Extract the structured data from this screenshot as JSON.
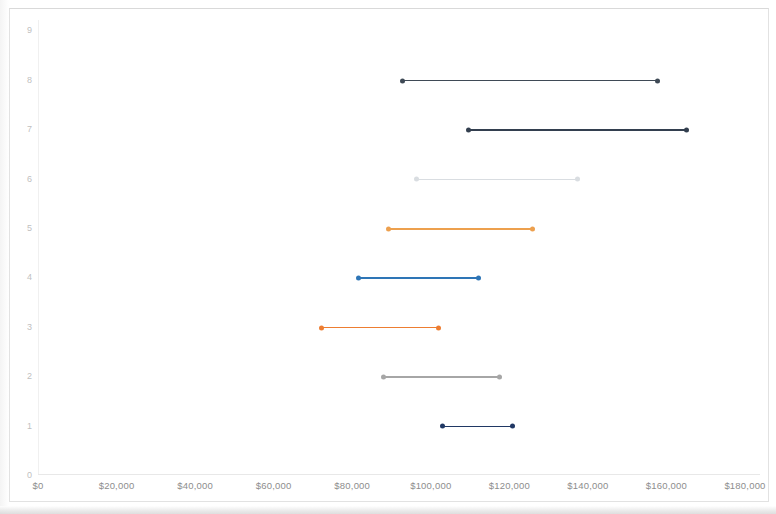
{
  "chart_data": {
    "type": "range-dot-plot",
    "title": "",
    "subtitle": "",
    "xlabel": "",
    "ylabel": "",
    "grid": false,
    "legend": "none",
    "xlim": [
      0,
      180000
    ],
    "ylim": [
      0,
      9
    ],
    "x_ticks": [
      {
        "label": "$0",
        "value": 0
      },
      {
        "label": "$20,000",
        "value": 20000
      },
      {
        "label": "$40,000",
        "value": 40000
      },
      {
        "label": "$60,000",
        "value": 60000
      },
      {
        "label": "$80,000",
        "value": 80000
      },
      {
        "label": "$100,000",
        "value": 100000
      },
      {
        "label": "$120,000",
        "value": 120000
      },
      {
        "label": "$140,000",
        "value": 140000
      },
      {
        "label": "$160,000",
        "value": 160000
      },
      {
        "label": "$180,000",
        "value": 180000
      }
    ],
    "y_ticks": [
      {
        "label": "0",
        "value": 0
      },
      {
        "label": "1",
        "value": 1
      },
      {
        "label": "2",
        "value": 2
      },
      {
        "label": "3",
        "value": 3
      },
      {
        "label": "4",
        "value": 4
      },
      {
        "label": "5",
        "value": 5
      },
      {
        "label": "6",
        "value": 6
      },
      {
        "label": "7",
        "value": 7
      },
      {
        "label": "8",
        "value": 8
      },
      {
        "label": "9",
        "value": 9
      }
    ],
    "series": [
      {
        "name": "row-8",
        "y": 8,
        "x_start": 92700,
        "x_end": 157900,
        "color": "#3f4a56"
      },
      {
        "name": "row-7",
        "y": 7,
        "x_start": 109500,
        "x_end": 165200,
        "color": "#333f4f"
      },
      {
        "name": "row-6",
        "y": 6,
        "x_start": 96200,
        "x_end": 137500,
        "color": "#d9dde1"
      },
      {
        "name": "row-5",
        "y": 5,
        "x_start": 89000,
        "x_end": 126000,
        "color": "#eda04e"
      },
      {
        "name": "row-4",
        "y": 4,
        "x_start": 81400,
        "x_end": 112200,
        "color": "#2e75b6"
      },
      {
        "name": "row-3",
        "y": 3,
        "x_start": 72000,
        "x_end": 102000,
        "color": "#ed7d31"
      },
      {
        "name": "row-2",
        "y": 2,
        "x_start": 87800,
        "x_end": 117600,
        "color": "#a6a6a6"
      },
      {
        "name": "row-1",
        "y": 1,
        "x_start": 102800,
        "x_end": 120900,
        "color": "#203864"
      }
    ]
  },
  "geometry": {
    "x_origin_px": 38,
    "x_span_px": 707,
    "x_max_value": 180000,
    "y_origin_px": 475,
    "y_step_px": 49.4
  },
  "style": {
    "frame_border": "#e2e2e2",
    "axis_color": "#e8e8e8",
    "xtick_color": "#8d8d8d",
    "ytick_color": "#bfbfbf",
    "background": "#ffffff"
  }
}
